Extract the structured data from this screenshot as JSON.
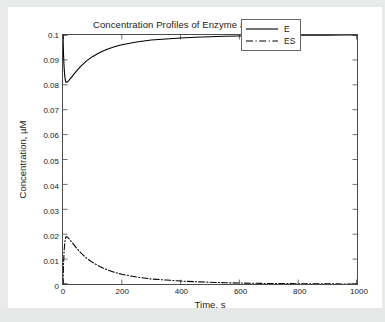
{
  "figure": {
    "title": "Concentration Profiles of Enzyme and Complex",
    "background_color": "#ffffff",
    "outer_background_color": "#e9eaea",
    "axis_color": "#4a4a4a"
  },
  "axes": {
    "xlabel": "Time, s",
    "ylabel": "Concentration, µM",
    "xticks": [
      "0",
      "200",
      "400",
      "600",
      "800",
      "1000"
    ],
    "yticks": [
      "0",
      "0.01",
      "0.02",
      "0.03",
      "0.04",
      "0.05",
      "0.06",
      "0.07",
      "0.08",
      "0.09",
      "0.1"
    ]
  },
  "legend": {
    "position": "upper-right",
    "entries": [
      {
        "label": "E",
        "style": "solid"
      },
      {
        "label": "ES",
        "style": "dash-dot"
      }
    ]
  },
  "chart_data": {
    "type": "line",
    "title": "Concentration Profiles of Enzyme and Complex",
    "xlabel": "Time, s",
    "ylabel": "Concentration, µM",
    "xlim": [
      0,
      1000
    ],
    "ylim": [
      0,
      0.1
    ],
    "xticks": [
      0,
      200,
      400,
      600,
      800,
      1000
    ],
    "yticks": [
      0,
      0.01,
      0.02,
      0.03,
      0.04,
      0.05,
      0.06,
      0.07,
      0.08,
      0.09,
      0.1
    ],
    "grid": false,
    "legend_position": "upper right",
    "x": [
      0,
      2,
      4,
      6,
      8,
      10,
      12,
      15,
      20,
      25,
      30,
      40,
      50,
      60,
      80,
      100,
      125,
      150,
      175,
      200,
      250,
      300,
      350,
      400,
      450,
      500,
      550,
      600,
      650,
      700,
      750,
      800,
      850,
      900,
      950,
      1000
    ],
    "series": [
      {
        "name": "E",
        "style": "solid",
        "color": "#000000",
        "values": [
          0.1,
          0.0915,
          0.0865,
          0.0835,
          0.0818,
          0.081,
          0.081,
          0.0812,
          0.0818,
          0.0825,
          0.0832,
          0.0847,
          0.0861,
          0.0874,
          0.0896,
          0.0913,
          0.093,
          0.0943,
          0.0953,
          0.0961,
          0.0972,
          0.098,
          0.0984,
          0.0988,
          0.0991,
          0.0993,
          0.0995,
          0.0996,
          0.0997,
          0.0998,
          0.0998,
          0.0999,
          0.0999,
          0.0999,
          0.1,
          0.1
        ]
      },
      {
        "name": "ES",
        "style": "dash-dot",
        "color": "#000000",
        "values": [
          0,
          0.0085,
          0.0135,
          0.0165,
          0.0182,
          0.019,
          0.019,
          0.0188,
          0.0182,
          0.0175,
          0.0168,
          0.0153,
          0.0139,
          0.0126,
          0.0104,
          0.0087,
          0.007,
          0.0057,
          0.0047,
          0.0039,
          0.0028,
          0.002,
          0.0016,
          0.0012,
          0.0009,
          0.0007,
          0.0005,
          0.0004,
          0.0003,
          0.0002,
          0.0002,
          0.0001,
          0.0001,
          0.0001,
          0.0,
          0.0
        ]
      }
    ]
  }
}
